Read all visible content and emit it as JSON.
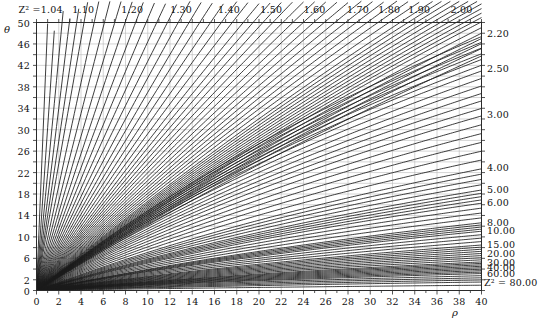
{
  "figure": {
    "kind": "nomogram",
    "x_axis": {
      "name": "ρ",
      "min": 0,
      "max": 40,
      "tick_step": 2,
      "minor_step": 1,
      "tick_labels": [
        "0",
        "2",
        "4",
        "6",
        "8",
        "10",
        "12",
        "14",
        "16",
        "18",
        "20",
        "22",
        "24",
        "26",
        "28",
        "30",
        "32",
        "34",
        "36",
        "38",
        "40"
      ]
    },
    "y_axis": {
      "name": "θ",
      "min": 0,
      "max": 50,
      "tick_step": 2,
      "tick_labels": [
        "2",
        "6",
        "10",
        "14",
        "18",
        "22",
        "26",
        "30",
        "34",
        "38",
        "42",
        "46",
        "50"
      ],
      "tick_values": [
        2,
        6,
        10,
        14,
        18,
        22,
        26,
        30,
        34,
        38,
        42,
        46,
        50
      ],
      "zero_label": "0"
    },
    "top_labels": {
      "prefix": "Z² =",
      "values": [
        "1.04",
        "1.10",
        "1.20",
        "1.30",
        "1.40",
        "1.50",
        "1.60",
        "1.70",
        "1.80",
        "1.90",
        "2.00"
      ]
    },
    "right_labels": {
      "values": [
        "2.20",
        "2.50",
        "3.00",
        "4.00",
        "5.00",
        "6.00",
        "8.00",
        "10.00",
        "15.00",
        "20.00",
        "30.00",
        "40.00",
        "60.00"
      ],
      "last_label": "Z² = 80.00",
      "last_value": "80.00"
    },
    "colors": {
      "curve": "#1a1a1a",
      "grid": "#b9b9b9",
      "grid_minor": "#d2d2d2",
      "frame": "#2a2a2a",
      "background": "#ffffff",
      "text": "#111111"
    }
  },
  "chart_data": {
    "type": "line",
    "title": "",
    "xlabel": "ρ",
    "ylabel": "θ",
    "xlim": [
      0,
      40
    ],
    "ylim": [
      0,
      50
    ],
    "grid": true,
    "legend": "top and right edge contour labels",
    "note": "Family of Z-squared contour curves over the (rho, theta) plane",
    "series": [
      {
        "name": "1.04",
        "label_edge": "top",
        "label_x": 1.0
      },
      {
        "name": "1.10",
        "label_edge": "top",
        "label_x": 4.2
      },
      {
        "name": "1.20",
        "label_edge": "top",
        "label_x": 8.6
      },
      {
        "name": "1.30",
        "label_edge": "top",
        "label_x": 13.0
      },
      {
        "name": "1.40",
        "label_edge": "top",
        "label_x": 17.3
      },
      {
        "name": "1.50",
        "label_edge": "top",
        "label_x": 21.1
      },
      {
        "name": "1.60",
        "label_edge": "top",
        "label_x": 25.0
      },
      {
        "name": "1.70",
        "label_edge": "top",
        "label_x": 28.9
      },
      {
        "name": "1.80",
        "label_edge": "top",
        "label_x": 31.7
      },
      {
        "name": "1.90",
        "label_edge": "top",
        "label_x": 34.4
      },
      {
        "name": "2.00",
        "label_edge": "top",
        "label_x": 38.2
      },
      {
        "name": "2.20",
        "label_edge": "right",
        "label_y": 48.0
      },
      {
        "name": "2.50",
        "label_edge": "right",
        "label_y": 41.5
      },
      {
        "name": "3.00",
        "label_edge": "right",
        "label_y": 33.0
      },
      {
        "name": "4.00",
        "label_edge": "right",
        "label_y": 23.0
      },
      {
        "name": "5.00",
        "label_edge": "right",
        "label_y": 19.0
      },
      {
        "name": "6.00",
        "label_edge": "right",
        "label_y": 16.5
      },
      {
        "name": "8.00",
        "label_edge": "right",
        "label_y": 12.8
      },
      {
        "name": "10.00",
        "label_edge": "right",
        "label_y": 11.2
      },
      {
        "name": "15.00",
        "label_edge": "right",
        "label_y": 8.6
      },
      {
        "name": "20.00",
        "label_edge": "right",
        "label_y": 7.0
      },
      {
        "name": "30.00",
        "label_edge": "right",
        "label_y": 5.4
      },
      {
        "name": "40.00",
        "label_edge": "right",
        "label_y": 4.3
      },
      {
        "name": "60.00",
        "label_edge": "right",
        "label_y": 3.2
      },
      {
        "name": "80.00",
        "label_edge": "right",
        "label_y": 1.6
      }
    ]
  }
}
